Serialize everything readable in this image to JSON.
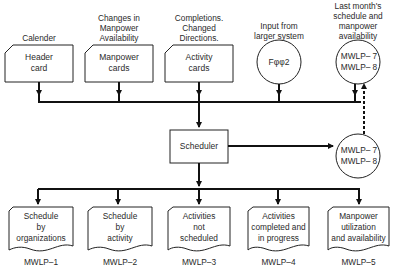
{
  "inputs": [
    {
      "caption": "Calender",
      "label_lines": [
        "Header",
        "card"
      ],
      "shape": "punched-card"
    },
    {
      "caption_lines": [
        "Changes in",
        "Manpower",
        "Availability"
      ],
      "label_lines": [
        "Manpower",
        "cards"
      ],
      "shape": "punched-card"
    },
    {
      "caption_lines": [
        "Completions.",
        "Changed",
        "Directions."
      ],
      "label_lines": [
        "Activity",
        "cards"
      ],
      "shape": "punched-card"
    },
    {
      "caption_lines": [
        "Input from",
        "larger system"
      ],
      "label": "Fφφ2",
      "shape": "circle"
    },
    {
      "caption_lines": [
        "Last month's",
        "schedule and",
        "manpower",
        "availability"
      ],
      "label_lines": [
        "MWLP– 7",
        "MWLP– 8"
      ],
      "shape": "circle"
    }
  ],
  "process": {
    "label": "Scheduler"
  },
  "output_file": {
    "label_lines": [
      "MWLP– 7",
      "MWLP– 8"
    ],
    "shape": "circle"
  },
  "reports": [
    {
      "label_lines": [
        "Schedule",
        "by",
        "organizations"
      ],
      "code": "MWLP–1"
    },
    {
      "label_lines": [
        "Schedule",
        "by",
        "activity"
      ],
      "code": "MWLP–2"
    },
    {
      "label_lines": [
        "Activities",
        "not",
        "scheduled"
      ],
      "code": "MWLP–3"
    },
    {
      "label_lines": [
        "Activities",
        "completed and",
        "in progress"
      ],
      "code": "MWLP–4"
    },
    {
      "label_lines": [
        "Manpower",
        "utilization",
        "and availability"
      ],
      "code": "MWLP–5"
    }
  ]
}
